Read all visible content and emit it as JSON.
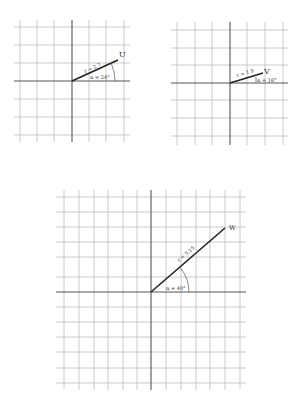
{
  "diagrams": [
    {
      "id": "U",
      "vector_label": "U",
      "r_label": "r = 2.7",
      "alpha_label": "α = 24°",
      "r": 2.7,
      "alpha_deg": 24
    },
    {
      "id": "V",
      "vector_label": "V",
      "r_label": "r = 1.9",
      "alpha_label": "α = 16°",
      "r": 1.9,
      "alpha_deg": 16
    },
    {
      "id": "W",
      "vector_label": "W",
      "r_label": "r = 5.15",
      "alpha_label": "α = 40°",
      "r": 5.15,
      "alpha_deg": 40
    }
  ],
  "colors": {
    "grid": "#bdbdbd",
    "axis": "#555555",
    "vector": "#222222"
  }
}
